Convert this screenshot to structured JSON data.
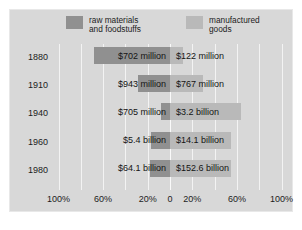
{
  "chart_data": {
    "type": "bar",
    "orientation": "horizontal",
    "subtype": "diverging-bidirectional",
    "title": "",
    "xlabel": "",
    "ylabel": "",
    "grid": true,
    "legend_position": "top",
    "categories": [
      "1880",
      "1910",
      "1940",
      "1960",
      "1980"
    ],
    "axis": {
      "ticks": [
        "100%",
        "60%",
        "20%",
        "0",
        "20%",
        "60%",
        "100%"
      ],
      "left_range": [
        100,
        0
      ],
      "right_range": [
        0,
        100
      ],
      "zero_label": "0"
    },
    "series": [
      {
        "name": "raw materials and foodstuffs",
        "side": "left",
        "color": "#909090",
        "labels": [
          "$702 million",
          "$943 million",
          "$705 million",
          "$5.4 billion",
          "$64.1 billion"
        ],
        "percents": [
          68,
          29,
          8,
          17,
          18
        ]
      },
      {
        "name": "manufactured goods",
        "side": "right",
        "color": "#b9b9b9",
        "labels": [
          "$122 million",
          "$767 million",
          "$3.2 billion",
          "$14.1 billion",
          "$152.6 billion"
        ],
        "percents": [
          12,
          30,
          64,
          55,
          55
        ]
      }
    ]
  },
  "legend": {
    "raw": {
      "line1": "raw materials",
      "line2": "and foodstuffs",
      "swatch": "#909090"
    },
    "manufactured": {
      "line1": "manufactured",
      "line2": "goods",
      "swatch": "#b9b9b9"
    }
  },
  "rows": [
    {
      "year": "1880",
      "left_label": "$702 million",
      "right_label": "$122 million"
    },
    {
      "year": "1910",
      "left_label": "$943 million",
      "right_label": "$767 million"
    },
    {
      "year": "1940",
      "left_label": "$705 million",
      "right_label": "$3.2 billion"
    },
    {
      "year": "1960",
      "left_label": "$5.4 billion",
      "right_label": "$14.1 billion"
    },
    {
      "year": "1980",
      "left_label": "$64.1 billion",
      "right_label": "$152.6 billion"
    }
  ],
  "axis_ticks": [
    {
      "text": "100%"
    },
    {
      "text": "60%"
    },
    {
      "text": "20%"
    },
    {
      "text": "0"
    },
    {
      "text": "20%"
    },
    {
      "text": "60%"
    },
    {
      "text": "100%"
    }
  ]
}
